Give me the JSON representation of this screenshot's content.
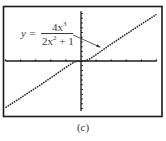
{
  "chart_data": {
    "type": "line",
    "title": "",
    "caption": "(c)",
    "annotation": {
      "label_prefix": "y =",
      "numerator": "4x",
      "numerator_exp": "3",
      "denominator_base": "2x",
      "denominator_exp": "2",
      "denominator_tail": "+ 1",
      "expression": "y = 4x^3 / (2x^2 + 1)"
    },
    "xlabel": "",
    "ylabel": "",
    "xlim": [
      -5,
      5
    ],
    "ylim": [
      -10.5,
      10.5
    ],
    "x_tick_step": 1,
    "y_tick_step": 1,
    "grid": false,
    "legend": null,
    "series": [
      {
        "name": "y = 4x^3/(2x^2+1)",
        "style": "dotted",
        "x": [
          -5,
          -4,
          -3,
          -2,
          -1,
          -0.5,
          0,
          0.5,
          1,
          2,
          3,
          4,
          5
        ],
        "values": [
          -9.8,
          -7.76,
          -5.68,
          -3.56,
          -1.33,
          -0.33,
          0,
          0.33,
          1.33,
          3.56,
          5.68,
          7.76,
          9.8
        ]
      }
    ]
  },
  "colors": {
    "frame": "#1a1a1a",
    "axis": "#1a1a1a",
    "curve": "#222222",
    "text": "#3a3a3a",
    "background": "#ffffff"
  }
}
